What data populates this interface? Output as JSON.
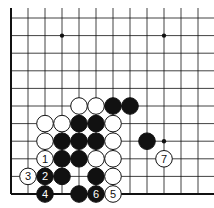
{
  "board": {
    "cols": 12,
    "rows": 11,
    "x0": 11,
    "dx": 17,
    "y0": 18,
    "dy": 17.6,
    "edges": [
      "left",
      "bottom"
    ],
    "star_points": [
      [
        3,
        1
      ],
      [
        9,
        1
      ],
      [
        9,
        7
      ]
    ]
  },
  "stones": [
    {
      "c": 4,
      "r": 5,
      "color": "white",
      "label": ""
    },
    {
      "c": 5,
      "r": 5,
      "color": "white",
      "label": ""
    },
    {
      "c": 6,
      "r": 5,
      "color": "black",
      "label": ""
    },
    {
      "c": 7,
      "r": 5,
      "color": "black",
      "label": ""
    },
    {
      "c": 2,
      "r": 6,
      "color": "white",
      "label": ""
    },
    {
      "c": 3,
      "r": 6,
      "color": "white",
      "label": ""
    },
    {
      "c": 4,
      "r": 6,
      "color": "black",
      "label": ""
    },
    {
      "c": 5,
      "r": 6,
      "color": "black",
      "label": ""
    },
    {
      "c": 6,
      "r": 6,
      "color": "white",
      "label": ""
    },
    {
      "c": 2,
      "r": 7,
      "color": "white",
      "label": ""
    },
    {
      "c": 3,
      "r": 7,
      "color": "black",
      "label": ""
    },
    {
      "c": 4,
      "r": 7,
      "color": "black",
      "label": ""
    },
    {
      "c": 5,
      "r": 7,
      "color": "black",
      "label": ""
    },
    {
      "c": 6,
      "r": 7,
      "color": "white",
      "label": ""
    },
    {
      "c": 8,
      "r": 7,
      "color": "black",
      "label": ""
    },
    {
      "c": 2,
      "r": 8,
      "color": "white",
      "label": "1"
    },
    {
      "c": 3,
      "r": 8,
      "color": "black",
      "label": ""
    },
    {
      "c": 4,
      "r": 8,
      "color": "black",
      "label": ""
    },
    {
      "c": 5,
      "r": 8,
      "color": "white",
      "label": ""
    },
    {
      "c": 6,
      "r": 8,
      "color": "white",
      "label": ""
    },
    {
      "c": 9,
      "r": 8,
      "color": "white",
      "label": "7"
    },
    {
      "c": 1,
      "r": 9,
      "color": "white",
      "label": "3"
    },
    {
      "c": 2,
      "r": 9,
      "color": "black",
      "label": "2"
    },
    {
      "c": 3,
      "r": 9,
      "color": "black",
      "label": ""
    },
    {
      "c": 5,
      "r": 9,
      "color": "black",
      "label": ""
    },
    {
      "c": 6,
      "r": 9,
      "color": "white",
      "label": ""
    },
    {
      "c": 2,
      "r": 10,
      "color": "black",
      "label": "4"
    },
    {
      "c": 4,
      "r": 10,
      "color": "black",
      "label": ""
    },
    {
      "c": 5,
      "r": 10,
      "color": "black",
      "label": "6"
    },
    {
      "c": 6,
      "r": 10,
      "color": "white",
      "label": "5"
    }
  ]
}
